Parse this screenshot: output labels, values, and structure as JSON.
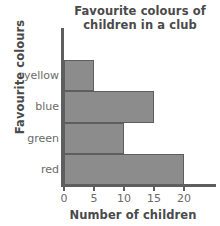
{
  "chart_data": {
    "type": "bar",
    "orientation": "horizontal",
    "title": "Favourite colours of children in a club",
    "title_lines": [
      "Favourite colours of",
      "children in a club"
    ],
    "xlabel": "Number of children",
    "ylabel": "Favourite colours",
    "categories": [
      "yellow",
      "blue",
      "green",
      "red"
    ],
    "values": [
      5,
      15,
      10,
      20
    ],
    "xticks": [
      0,
      5,
      10,
      15,
      20
    ],
    "xtick_labels": [
      "0",
      "5",
      "10",
      "15",
      "20"
    ],
    "xlim": [
      0,
      20
    ],
    "grid": false,
    "legend": false,
    "bar_color": "#8c8c8c",
    "bar_edge_color": "#5e5e5e",
    "axis_color": "#5e5e5e",
    "text_color": "#4a4a4a",
    "background": "#ffffff"
  }
}
